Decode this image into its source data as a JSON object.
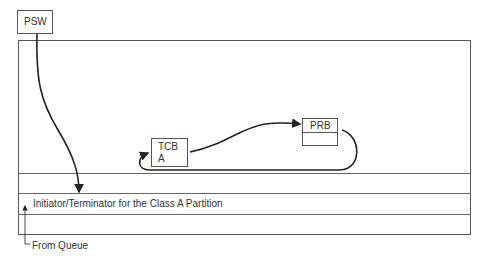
{
  "diagram": {
    "psw": {
      "label": "PSW"
    },
    "tcb": {
      "line1": "TCB",
      "line2": "A"
    },
    "prb": {
      "label": "PRB"
    },
    "initiator_row": {
      "label": "Initiator/Terminator for the Class A Partition"
    },
    "queue": {
      "label": "From Queue"
    },
    "colors": {
      "line": "#222222",
      "border": "#555555",
      "background": "#ffffff"
    }
  }
}
